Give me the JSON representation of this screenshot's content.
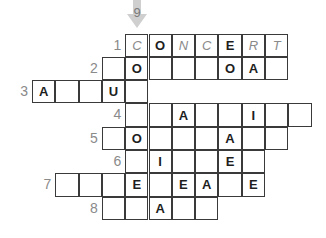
{
  "puzzle": {
    "down_clue_number": "9",
    "rows": [
      {
        "number": "1",
        "start_col": 4,
        "cells": [
          {
            "letter": "C",
            "hint": true
          },
          {
            "letter": "O",
            "hint": false
          },
          {
            "letter": "N",
            "hint": true
          },
          {
            "letter": "C",
            "hint": true
          },
          {
            "letter": "E",
            "hint": false
          },
          {
            "letter": "R",
            "hint": true
          },
          {
            "letter": "T",
            "hint": true
          }
        ]
      },
      {
        "number": "2",
        "start_col": 3,
        "cells": [
          {
            "letter": ""
          },
          {
            "letter": "O"
          },
          {
            "letter": ""
          },
          {
            "letter": ""
          },
          {
            "letter": ""
          },
          {
            "letter": "O"
          },
          {
            "letter": "A"
          },
          {
            "letter": ""
          }
        ]
      },
      {
        "number": "3",
        "start_col": 0,
        "cells": [
          {
            "letter": "A"
          },
          {
            "letter": ""
          },
          {
            "letter": ""
          },
          {
            "letter": "U"
          },
          {
            "letter": ""
          }
        ]
      },
      {
        "number": "4",
        "start_col": 4,
        "cells": [
          {
            "letter": ""
          },
          {
            "letter": ""
          },
          {
            "letter": "A"
          },
          {
            "letter": ""
          },
          {
            "letter": ""
          },
          {
            "letter": "I"
          },
          {
            "letter": ""
          },
          {
            "letter": ""
          }
        ]
      },
      {
        "number": "5",
        "start_col": 3,
        "cells": [
          {
            "letter": ""
          },
          {
            "letter": "O"
          },
          {
            "letter": ""
          },
          {
            "letter": ""
          },
          {
            "letter": ""
          },
          {
            "letter": "A"
          },
          {
            "letter": ""
          },
          {
            "letter": ""
          }
        ]
      },
      {
        "number": "6",
        "start_col": 4,
        "cells": [
          {
            "letter": ""
          },
          {
            "letter": "I"
          },
          {
            "letter": ""
          },
          {
            "letter": ""
          },
          {
            "letter": "E"
          },
          {
            "letter": ""
          }
        ]
      },
      {
        "number": "7",
        "start_col": 1,
        "cells": [
          {
            "letter": ""
          },
          {
            "letter": ""
          },
          {
            "letter": ""
          },
          {
            "letter": "E"
          },
          {
            "letter": ""
          },
          {
            "letter": "E"
          },
          {
            "letter": "A"
          },
          {
            "letter": ""
          },
          {
            "letter": "E"
          }
        ]
      },
      {
        "number": "8",
        "start_col": 3,
        "cells": [
          {
            "letter": ""
          },
          {
            "letter": ""
          },
          {
            "letter": "A"
          },
          {
            "letter": ""
          },
          {
            "letter": ""
          }
        ]
      }
    ]
  }
}
